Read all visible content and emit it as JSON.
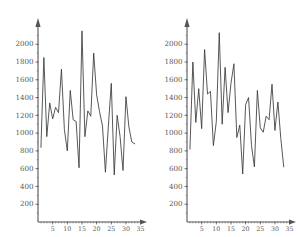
{
  "figure": {
    "title": "",
    "background": "#ffffff",
    "line_color": "#3a3a3a",
    "axis_color": "#555555",
    "label_color": "#5a5a5a",
    "panel_count": 2
  },
  "chart_data": [
    {
      "type": "line",
      "panel": "left",
      "title": "",
      "xlabel": "",
      "ylabel": "",
      "xlim": [
        0,
        36.5
      ],
      "ylim": [
        0,
        2250
      ],
      "grid": false,
      "legend": null,
      "xticks": [
        5,
        10,
        15,
        20,
        25,
        30,
        35
      ],
      "xtick_labels": [
        "5",
        "10",
        "15",
        "20",
        "25",
        "30",
        "35"
      ],
      "yticks": [
        200,
        400,
        600,
        800,
        1000,
        1200,
        1400,
        1600,
        1800,
        2000
      ],
      "ytick_labels": [
        "200",
        "400",
        "600",
        "800",
        "1000",
        "1200",
        "1400",
        "1600",
        "1800",
        "2000"
      ],
      "x": [
        1,
        2,
        3,
        4,
        5,
        6,
        7,
        8,
        9,
        10,
        11,
        12,
        13,
        14,
        15,
        16,
        17,
        18,
        19,
        20,
        21,
        22,
        23,
        24,
        25,
        26,
        27,
        28,
        29,
        30,
        31,
        32,
        33
      ],
      "values": [
        840,
        1850,
        960,
        1340,
        1160,
        1290,
        1230,
        1720,
        1040,
        800,
        1480,
        1150,
        1130,
        610,
        2150,
        960,
        1250,
        1190,
        1900,
        1430,
        1240,
        1080,
        560,
        1080,
        1560,
        530,
        1200,
        960,
        580,
        1410,
        1070,
        900,
        880
      ]
    },
    {
      "type": "line",
      "panel": "right",
      "title": "",
      "xlabel": "",
      "ylabel": "",
      "xlim": [
        0,
        36.5
      ],
      "ylim": [
        0,
        2250
      ],
      "grid": false,
      "legend": null,
      "xticks": [
        5,
        10,
        15,
        20,
        25,
        30,
        35
      ],
      "xtick_labels": [
        "5",
        "10",
        "15",
        "20",
        "25",
        "30",
        "35"
      ],
      "yticks": [
        200,
        400,
        600,
        800,
        1000,
        1200,
        1400,
        1600,
        1800,
        2000
      ],
      "ytick_labels": [
        "200",
        "400",
        "600",
        "800",
        "1000",
        "1200",
        "1400",
        "1600",
        "1800",
        "2000"
      ],
      "x": [
        1,
        2,
        3,
        4,
        5,
        6,
        7,
        8,
        9,
        10,
        11,
        12,
        13,
        14,
        15,
        16,
        17,
        18,
        19,
        20,
        21,
        22,
        23,
        24,
        25,
        26,
        27,
        28,
        29,
        30,
        31,
        32,
        33
      ],
      "values": [
        820,
        1800,
        1120,
        1500,
        1050,
        1940,
        1440,
        1470,
        860,
        1130,
        2130,
        1100,
        1740,
        1230,
        1560,
        1780,
        950,
        1090,
        540,
        1320,
        1400,
        860,
        620,
        1480,
        1060,
        1010,
        1190,
        1150,
        1550,
        1030,
        1350,
        940,
        620
      ]
    }
  ],
  "panels": {
    "left": {
      "name": "left-plot",
      "x_axis_name": "x-axis",
      "y_axis_name": "y-axis"
    },
    "right": {
      "name": "right-plot",
      "x_axis_name": "x-axis",
      "y_axis_name": "y-axis"
    }
  }
}
